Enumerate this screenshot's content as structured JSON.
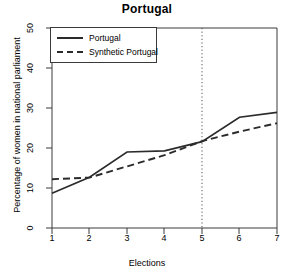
{
  "chart_data": {
    "type": "line",
    "title": "Portugal",
    "xlabel": "Elections",
    "ylabel": "Percentage of women in national parliament",
    "x": [
      1,
      2,
      3,
      4,
      5,
      6,
      7
    ],
    "xticks": [
      "1",
      "2",
      "3",
      "4",
      "5",
      "6",
      "7"
    ],
    "yticks": [
      "0",
      "10",
      "20",
      "30",
      "40",
      "50"
    ],
    "ylim": [
      0,
      50
    ],
    "xlim": [
      1,
      7
    ],
    "grid": false,
    "legend_position": "top-left",
    "series": [
      {
        "name": "Portugal",
        "style": "solid",
        "color": "#2b2b2b",
        "values": [
          8.7,
          12.7,
          19.0,
          19.3,
          21.6,
          27.7,
          28.9
        ]
      },
      {
        "name": "Synthetic Portugal",
        "style": "dashed",
        "color": "#2b2b2b",
        "values": [
          12.2,
          12.6,
          15.4,
          18.2,
          21.7,
          24.1,
          26.2
        ]
      }
    ],
    "annotations": [
      {
        "name": "treatment-line",
        "type": "vertical-dotted-line",
        "x": 5,
        "color": "#555555"
      }
    ]
  },
  "legend": {
    "items": [
      {
        "label": "Portugal",
        "style": "solid"
      },
      {
        "label": "Synthetic Portugal",
        "style": "dashed"
      }
    ]
  }
}
